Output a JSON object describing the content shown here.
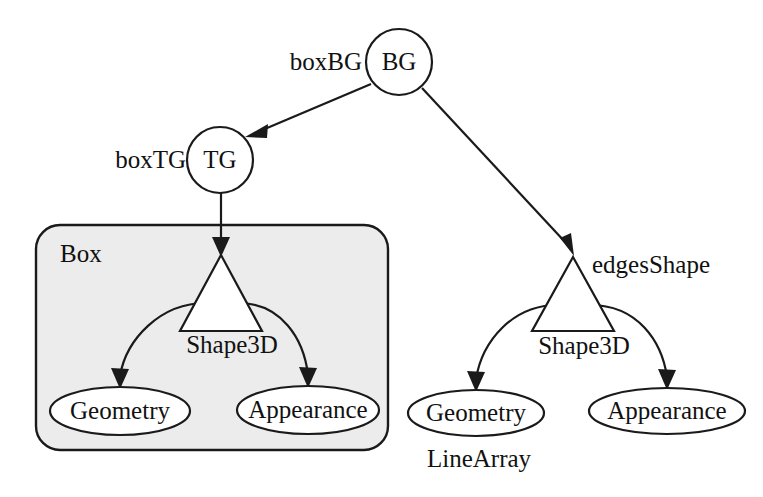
{
  "diagram": {
    "type": "scene-graph",
    "background_color": "#ffffff",
    "stroke_color": "#1a1a1a",
    "group_fill_color": "#ececec"
  },
  "nodes": {
    "bg": {
      "label": "BG",
      "side_label": "boxBG",
      "shape": "circle",
      "cx": 399,
      "cy": 62,
      "r": 33
    },
    "tg": {
      "label": "TG",
      "side_label": "boxTG",
      "shape": "circle",
      "cx": 220,
      "cy": 160,
      "r": 33
    },
    "box_shape3d": {
      "label": "Shape3D",
      "shape": "triangle",
      "apex_x": 221,
      "apex_y": 255,
      "base_y": 331,
      "half_width": 41
    },
    "edges_shape3d": {
      "label": "Shape3D",
      "side_label": "edgesShape",
      "shape": "triangle",
      "apex_x": 573,
      "apex_y": 257,
      "base_y": 331,
      "half_width": 41
    },
    "box_geometry": {
      "label": "Geometry",
      "shape": "ellipse",
      "cx": 120,
      "cy": 411,
      "rx": 70,
      "ry": 24
    },
    "box_appearance": {
      "label": "Appearance",
      "shape": "ellipse",
      "cx": 308,
      "cy": 410,
      "rx": 71,
      "ry": 24
    },
    "edges_geometry": {
      "label": "Geometry",
      "shape": "ellipse",
      "sub_label": "LineArray",
      "cx": 476,
      "cy": 413,
      "rx": 68,
      "ry": 23
    },
    "edges_appearance": {
      "label": "Appearance",
      "shape": "ellipse",
      "cx": 667,
      "cy": 411,
      "rx": 78,
      "ry": 23
    }
  },
  "groups": {
    "box_region": {
      "label": "Box",
      "x": 36,
      "y": 225,
      "width": 352,
      "height": 225,
      "radius": 24
    }
  },
  "edges": [
    {
      "name": "bg-to-tg",
      "from": "bg",
      "to": "tg",
      "style": "straight",
      "arrow": true
    },
    {
      "name": "bg-to-edges-shape",
      "from": "bg",
      "to": "edges_shape3d",
      "style": "straight",
      "arrow": true
    },
    {
      "name": "tg-to-box-shape",
      "from": "tg",
      "to": "box_shape3d",
      "style": "straight",
      "arrow": true
    },
    {
      "name": "box-shape-to-geometry",
      "from": "box_shape3d",
      "to": "box_geometry",
      "style": "curved",
      "arrow": true
    },
    {
      "name": "box-shape-to-appearance",
      "from": "box_shape3d",
      "to": "box_appearance",
      "style": "curved",
      "arrow": true
    },
    {
      "name": "edges-shape-to-geometry",
      "from": "edges_shape3d",
      "to": "edges_geometry",
      "style": "curved",
      "arrow": true
    },
    {
      "name": "edges-shape-to-appearance",
      "from": "edges_shape3d",
      "to": "edges_appearance",
      "style": "curved",
      "arrow": true
    }
  ]
}
